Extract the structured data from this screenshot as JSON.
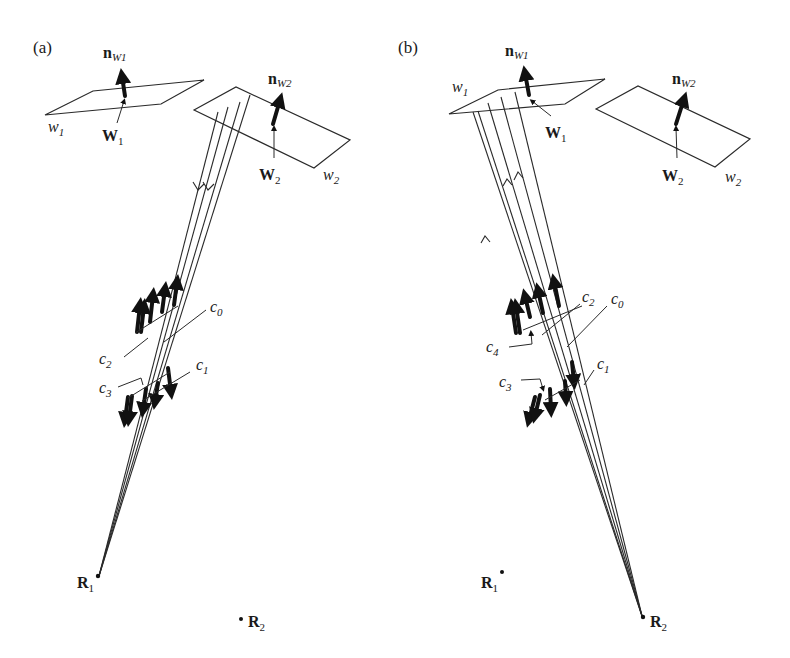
{
  "figure": {
    "panels": [
      {
        "id": "a",
        "label": "(a)",
        "walls": [
          {
            "name": "w",
            "sub": "1",
            "point": "W",
            "point_sub": "1",
            "normal": "n",
            "normal_sub": "W1"
          },
          {
            "name": "w",
            "sub": "2",
            "point": "W",
            "point_sub": "2",
            "normal": "n",
            "normal_sub": "W2"
          }
        ],
        "components": [
          {
            "name": "c",
            "sub": "0"
          },
          {
            "name": "c",
            "sub": "1"
          },
          {
            "name": "c",
            "sub": "2"
          },
          {
            "name": "c",
            "sub": "3"
          }
        ],
        "receivers": [
          {
            "name": "R",
            "sub": "1",
            "active": true
          },
          {
            "name": "R",
            "sub": "2",
            "active": false
          }
        ],
        "ray_direction": "from wall w2 down toward R1"
      },
      {
        "id": "b",
        "label": "(b)",
        "walls": [
          {
            "name": "w",
            "sub": "1",
            "point": "W",
            "point_sub": "1",
            "normal": "n",
            "normal_sub": "W1"
          },
          {
            "name": "w",
            "sub": "2",
            "point": "W",
            "point_sub": "2",
            "normal": "n",
            "normal_sub": "W2"
          }
        ],
        "components": [
          {
            "name": "c",
            "sub": "0"
          },
          {
            "name": "c",
            "sub": "1"
          },
          {
            "name": "c",
            "sub": "2"
          },
          {
            "name": "c",
            "sub": "3"
          },
          {
            "name": "c",
            "sub": "4"
          }
        ],
        "receivers": [
          {
            "name": "R",
            "sub": "1",
            "active": false
          },
          {
            "name": "R",
            "sub": "2",
            "active": true
          }
        ],
        "ray_direction": "from R2 up toward wall w1"
      }
    ]
  }
}
